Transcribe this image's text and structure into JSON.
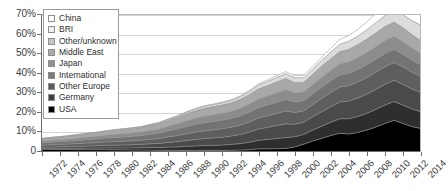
{
  "chart_data": {
    "type": "area",
    "stacked": true,
    "title": "",
    "subtitle": "",
    "xlabel": "",
    "ylabel": "",
    "grid": true,
    "legend_position": "top-left",
    "xlim": [
      1972,
      2014
    ],
    "ylim": [
      0,
      70
    ],
    "y_unit": "%",
    "y_ticks": [
      "0",
      "10%",
      "20%",
      "30%",
      "40%",
      "50%",
      "60%",
      "70%"
    ],
    "y_tick_values": [
      0,
      10,
      20,
      30,
      40,
      50,
      60,
      70
    ],
    "x_ticks": [
      "1972",
      "1974",
      "1976",
      "1978",
      "1980",
      "1982",
      "1984",
      "1986",
      "1988",
      "1990",
      "1992",
      "1994",
      "1996",
      "1998",
      "2000",
      "2002",
      "2004",
      "2006",
      "2008",
      "2010",
      "2012",
      "2014"
    ],
    "x": [
      1972,
      1973,
      1974,
      1975,
      1976,
      1977,
      1978,
      1979,
      1980,
      1981,
      1982,
      1983,
      1984,
      1985,
      1986,
      1987,
      1988,
      1989,
      1990,
      1991,
      1992,
      1993,
      1994,
      1995,
      1996,
      1997,
      1998,
      1999,
      2000,
      2001,
      2002,
      2003,
      2004,
      2005,
      2006,
      2007,
      2008,
      2009,
      2010,
      2011,
      2012,
      2013,
      2014
    ],
    "series": [
      {
        "name": "USA",
        "color": "#000000",
        "values": [
          1.4,
          1.4,
          1.3,
          1.3,
          1.2,
          1.2,
          1.2,
          1.2,
          1.1,
          1.1,
          1.0,
          1.0,
          1.0,
          0.9,
          0.9,
          0.8,
          0.8,
          0.8,
          0.8,
          0.8,
          0.8,
          0.9,
          1.0,
          1.2,
          1.6,
          1.6,
          1.7,
          1.8,
          2.6,
          4.0,
          5.6,
          7.0,
          8.4,
          9.6,
          9.2,
          10.0,
          11.2,
          12.8,
          14.6,
          16.2,
          14.6,
          13.0,
          12.0
        ]
      },
      {
        "name": "Germany",
        "color": "#2e2e2e",
        "values": [
          0.5,
          0.5,
          0.6,
          0.6,
          0.7,
          0.8,
          0.8,
          0.9,
          1.0,
          1.0,
          1.1,
          1.2,
          1.3,
          1.4,
          1.6,
          1.8,
          2.1,
          2.3,
          2.5,
          2.6,
          2.8,
          3.0,
          3.3,
          3.8,
          4.4,
          4.8,
          5.2,
          5.6,
          5.2,
          5.0,
          5.6,
          6.2,
          6.8,
          7.4,
          7.8,
          8.2,
          8.6,
          9.0,
          9.4,
          9.6,
          9.4,
          9.0,
          8.6
        ]
      },
      {
        "name": "Other Europe",
        "color": "#4a4a4a",
        "values": [
          0.6,
          0.7,
          0.8,
          0.9,
          1.0,
          1.1,
          1.2,
          1.3,
          1.4,
          1.5,
          1.6,
          1.7,
          1.9,
          2.1,
          2.4,
          2.7,
          3.0,
          3.3,
          3.6,
          3.8,
          4.0,
          4.3,
          4.7,
          5.2,
          5.8,
          6.2,
          6.6,
          7.0,
          6.4,
          6.2,
          6.8,
          7.4,
          8.0,
          8.6,
          9.0,
          9.4,
          9.8,
          10.2,
          10.6,
          10.8,
          10.6,
          10.2,
          9.8
        ]
      },
      {
        "name": "International",
        "color": "#5e5e5e",
        "values": [
          1.0,
          1.1,
          1.2,
          1.3,
          1.4,
          1.5,
          1.6,
          1.7,
          1.8,
          1.9,
          2.0,
          2.1,
          2.3,
          2.5,
          2.8,
          3.1,
          3.4,
          3.7,
          3.9,
          4.1,
          4.3,
          4.5,
          4.8,
          5.2,
          5.6,
          5.9,
          6.2,
          6.5,
          6.0,
          5.8,
          6.2,
          6.8,
          7.2,
          7.6,
          7.9,
          8.2,
          8.5,
          8.8,
          9.0,
          9.1,
          8.9,
          8.6,
          8.2
        ]
      },
      {
        "name": "Japan",
        "color": "#737373",
        "values": [
          1.2,
          1.3,
          1.4,
          1.5,
          1.6,
          1.7,
          1.8,
          2.0,
          2.1,
          2.2,
          2.3,
          2.4,
          2.6,
          2.8,
          3.1,
          3.4,
          3.7,
          4.0,
          4.2,
          4.3,
          4.4,
          4.5,
          4.7,
          5.0,
          5.3,
          5.5,
          5.7,
          5.9,
          5.4,
          5.2,
          5.4,
          5.8,
          6.0,
          6.2,
          6.3,
          6.4,
          6.5,
          6.6,
          6.7,
          6.7,
          6.5,
          6.2,
          5.9
        ]
      },
      {
        "name": "Middle East",
        "color": "#8c8c8c",
        "values": [
          0.8,
          0.9,
          0.9,
          1.0,
          1.1,
          1.2,
          1.3,
          1.4,
          1.5,
          1.6,
          1.7,
          1.8,
          1.9,
          2.1,
          2.3,
          2.6,
          2.9,
          3.1,
          3.3,
          3.4,
          3.5,
          3.6,
          3.8,
          4.1,
          4.4,
          4.6,
          4.8,
          5.0,
          4.6,
          4.4,
          4.7,
          5.0,
          5.3,
          5.6,
          5.8,
          6.0,
          6.2,
          6.4,
          6.5,
          6.6,
          6.4,
          6.1,
          5.8
        ]
      },
      {
        "name": "Other/unknown",
        "color": "#a8a8a8",
        "values": [
          1.2,
          1.3,
          1.4,
          1.5,
          1.6,
          1.7,
          1.8,
          1.9,
          2.0,
          2.1,
          2.2,
          2.3,
          2.5,
          2.7,
          3.0,
          3.3,
          3.6,
          3.9,
          4.1,
          4.2,
          4.3,
          4.4,
          4.6,
          4.9,
          5.2,
          5.4,
          5.6,
          5.8,
          5.3,
          5.1,
          5.4,
          5.7,
          6.0,
          6.3,
          6.5,
          6.7,
          6.9,
          7.1,
          7.3,
          7.4,
          7.2,
          6.9,
          6.6
        ]
      },
      {
        "name": "BRI",
        "color": "#dcdcdc",
        "values": [
          0.2,
          0.2,
          0.2,
          0.2,
          0.3,
          0.3,
          0.3,
          0.3,
          0.4,
          0.4,
          0.4,
          0.4,
          0.5,
          0.5,
          0.6,
          0.7,
          0.8,
          0.9,
          1.0,
          1.0,
          1.1,
          1.2,
          1.4,
          1.6,
          1.9,
          2.1,
          2.3,
          2.5,
          2.4,
          2.4,
          2.7,
          3.0,
          3.4,
          3.8,
          4.1,
          4.4,
          4.8,
          5.2,
          5.6,
          6.0,
          6.6,
          7.2,
          7.8
        ]
      },
      {
        "name": "China",
        "color": "#ffffff",
        "values": [
          0.1,
          0.1,
          0.1,
          0.1,
          0.1,
          0.1,
          0.1,
          0.1,
          0.1,
          0.1,
          0.1,
          0.1,
          0.1,
          0.2,
          0.2,
          0.2,
          0.2,
          0.3,
          0.3,
          0.3,
          0.4,
          0.4,
          0.5,
          0.6,
          0.7,
          0.8,
          0.9,
          1.0,
          1.0,
          1.1,
          1.3,
          1.6,
          2.0,
          2.4,
          2.9,
          3.4,
          4.0,
          4.6,
          5.2,
          5.8,
          6.2,
          6.6,
          6.8
        ]
      }
    ],
    "totals_note": "Stack total rises from about 7% in 1972 to about 65% in 2014, with a local peak near 38% in 1999 and a dip near 33% in 2001."
  },
  "legend": {
    "items": [
      {
        "label": "China",
        "color": "#ffffff"
      },
      {
        "label": "BRI",
        "color": "#f0f0f0"
      },
      {
        "label": "Other/unknown",
        "color": "#c6c6c6"
      },
      {
        "label": "Middle East",
        "color": "#ababab"
      },
      {
        "label": "Japan",
        "color": "#939393"
      },
      {
        "label": "International",
        "color": "#7b7b7b"
      },
      {
        "label": "Other Europe",
        "color": "#5c5c5c"
      },
      {
        "label": "Germany",
        "color": "#3f3f3f"
      },
      {
        "label": "USA",
        "color": "#000000"
      }
    ]
  }
}
